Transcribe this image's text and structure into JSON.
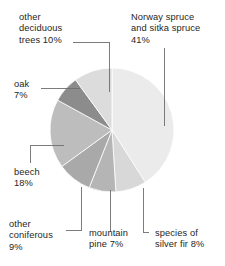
{
  "chart_data": {
    "type": "pie",
    "title": "",
    "subtitle": "",
    "xlabel": "",
    "ylabel": "",
    "legend_position": "none",
    "grid": false,
    "units": "percent",
    "total": 100,
    "categories": [
      "Norway spruce and sitka spruce",
      "species of silver fir",
      "mountain pine",
      "other coniferous",
      "beech",
      "oak",
      "other deciduous trees"
    ],
    "values": [
      41,
      8,
      7,
      9,
      18,
      7,
      10
    ],
    "slices": [
      {
        "name": "norway-sitka-spruce",
        "label": "Norway spruce\nand sitka spruce\n41%",
        "label_text": "Norway spruce and sitka spruce",
        "value": 41,
        "value_text": "41%",
        "color": "#ebebeb",
        "start_angle": 0,
        "end_angle": 147.6
      },
      {
        "name": "species-of-silver-fir",
        "label": "species of\nsilver fir 8%",
        "label_text": "species of silver fir",
        "value": 8,
        "value_text": "8%",
        "color": "#d8d8d8",
        "start_angle": 147.6,
        "end_angle": 176.4
      },
      {
        "name": "mountain-pine",
        "label": "mountain\npine 7%",
        "label_text": "mountain pine",
        "value": 7,
        "value_text": "7%",
        "color": "#b5b5b5",
        "start_angle": 176.4,
        "end_angle": 201.6
      },
      {
        "name": "other-coniferous",
        "label": "other\nconiferous\n9%",
        "label_text": "other coniferous",
        "value": 9,
        "value_text": "9%",
        "color": "#a9a9a9",
        "start_angle": 201.6,
        "end_angle": 234.0
      },
      {
        "name": "beech",
        "label": "beech\n18%",
        "label_text": "beech",
        "value": 18,
        "value_text": "18%",
        "color": "#bdbdbd",
        "start_angle": 234.0,
        "end_angle": 298.8
      },
      {
        "name": "oak",
        "label": "oak\n7%",
        "label_text": "oak",
        "value": 7,
        "value_text": "7%",
        "color": "#8c8c8c",
        "start_angle": 298.8,
        "end_angle": 324.0
      },
      {
        "name": "other-deciduous-trees",
        "label": "other\ndeciduous\ntrees 10%",
        "label_text": "other deciduous trees",
        "value": 10,
        "value_text": "10%",
        "color": "#dcdcdc",
        "start_angle": 324.0,
        "end_angle": 360.0
      }
    ],
    "background_color": "#ffffff",
    "leader_line_color": "#6e6e6e",
    "text_color": "#262626"
  }
}
